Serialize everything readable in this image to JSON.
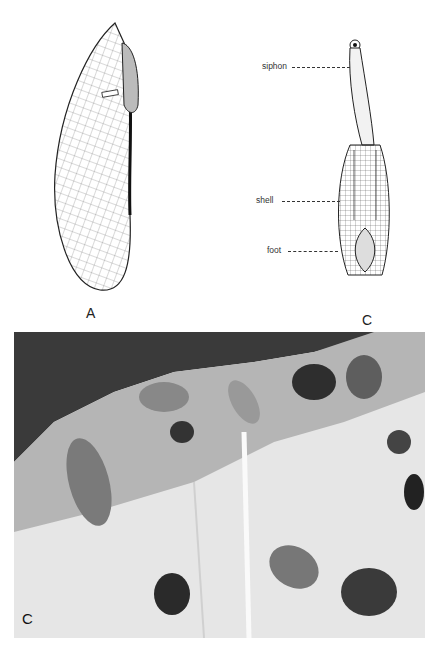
{
  "figure": {
    "panels": [
      {
        "id": "A",
        "letter": "A",
        "description": "shell drawing, side view"
      },
      {
        "id": "B",
        "letter": "B",
        "description": "animal drawing with labeled parts",
        "callouts": [
          {
            "text": "siphon"
          },
          {
            "text": "shell"
          },
          {
            "text": "foot"
          }
        ]
      },
      {
        "id": "C",
        "letter": "C",
        "description": "photograph of burrows in rock"
      }
    ]
  },
  "colors": {
    "ink": "#222222",
    "photo_dark": "#3a3a3a",
    "photo_mid": "#8a8a8a",
    "photo_light": "#e6e6e6"
  }
}
